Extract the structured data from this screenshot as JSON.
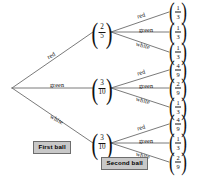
{
  "diagram": {
    "type": "probability-tree",
    "title": "",
    "root": {
      "x": 12,
      "y": 88
    },
    "stage_labels": [
      {
        "id": "first-ball",
        "text": "First ball",
        "x": 33,
        "y": 141
      },
      {
        "id": "second-ball",
        "text": "Second ball",
        "x": 101,
        "y": 157
      }
    ],
    "level1": [
      {
        "id": "red",
        "branch_label": "red",
        "probability": {
          "num": "2",
          "den": "5",
          "text": "2/5"
        },
        "node": {
          "x": 102,
          "y": 32
        },
        "label_pos": {
          "x": 51,
          "y": 55,
          "rotate": -29
        },
        "children": [
          {
            "id": "red-red",
            "branch_label": "red",
            "probability": {
              "num": "1",
              "den": "3",
              "text": "1/3"
            },
            "leaf": {
              "x": 178,
              "y": 12
            },
            "label_pos": {
              "x": 141,
              "y": 15,
              "rotate": -16
            }
          },
          {
            "id": "red-green",
            "branch_label": "green",
            "probability": {
              "num": "1",
              "den": "3",
              "text": "1/3"
            },
            "leaf": {
              "x": 178,
              "y": 32
            },
            "label_pos": {
              "x": 146,
              "y": 29,
              "rotate": 0
            }
          },
          {
            "id": "red-white",
            "branch_label": "white",
            "probability": {
              "num": "1",
              "den": "3",
              "text": "1/3"
            },
            "leaf": {
              "x": 178,
              "y": 52
            },
            "label_pos": {
              "x": 143,
              "y": 45,
              "rotate": 16
            }
          }
        ]
      },
      {
        "id": "green",
        "branch_label": "green",
        "probability": {
          "num": "3",
          "den": "10",
          "text": "3/10"
        },
        "node": {
          "x": 102,
          "y": 88
        },
        "label_pos": {
          "x": 57,
          "y": 84,
          "rotate": 0
        },
        "children": [
          {
            "id": "green-red",
            "branch_label": "red",
            "probability": {
              "num": "4",
              "den": "9",
              "text": "4/9"
            },
            "leaf": {
              "x": 178,
              "y": 70
            },
            "label_pos": {
              "x": 141,
              "y": 72,
              "rotate": -16
            }
          },
          {
            "id": "green-green",
            "branch_label": "green",
            "probability": {
              "num": "2",
              "den": "9",
              "text": "2/9"
            },
            "leaf": {
              "x": 178,
              "y": 88
            },
            "label_pos": {
              "x": 146,
              "y": 85,
              "rotate": 0
            }
          },
          {
            "id": "green-white",
            "branch_label": "white",
            "probability": {
              "num": "1",
              "den": "3",
              "text": "1/3"
            },
            "leaf": {
              "x": 178,
              "y": 107
            },
            "label_pos": {
              "x": 143,
              "y": 100,
              "rotate": 16
            }
          }
        ]
      },
      {
        "id": "white",
        "branch_label": "white",
        "probability": {
          "num": "3",
          "den": "10",
          "text": "3/10"
        },
        "node": {
          "x": 102,
          "y": 143
        },
        "label_pos": {
          "x": 57,
          "y": 119,
          "rotate": 29
        },
        "children": [
          {
            "id": "white-red",
            "branch_label": "red",
            "probability": {
              "num": "4",
              "den": "9",
              "text": "4/9"
            },
            "leaf": {
              "x": 178,
              "y": 124
            },
            "label_pos": {
              "x": 141,
              "y": 127,
              "rotate": -16
            }
          },
          {
            "id": "white-green",
            "branch_label": "green",
            "probability": {
              "num": "1",
              "den": "3",
              "text": "1/3"
            },
            "leaf": {
              "x": 178,
              "y": 143
            },
            "label_pos": {
              "x": 146,
              "y": 140,
              "rotate": 0
            }
          },
          {
            "id": "white-white",
            "branch_label": "white",
            "probability": {
              "num": "2",
              "den": "9",
              "text": "2/9"
            },
            "leaf": {
              "x": 178,
              "y": 162
            },
            "label_pos": {
              "x": 143,
              "y": 155,
              "rotate": 16
            }
          }
        ]
      }
    ],
    "colors": {
      "line": "#6b6b6b",
      "text": "#111111",
      "box_fill": "#c8c8c8",
      "box_border": "#6d6d6d",
      "background": "#ffffff"
    }
  }
}
